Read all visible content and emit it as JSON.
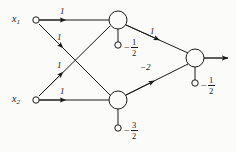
{
  "figure": {
    "kind": "neural-network-diagram",
    "background_color": "#fbfbf9",
    "ink_color": "#1a1a1a",
    "width": 236,
    "height": 152
  },
  "inputs": [
    {
      "id": "x1",
      "label": "x",
      "subscript": "1",
      "x": 28,
      "y": 20
    },
    {
      "id": "x2",
      "label": "x",
      "subscript": "2",
      "x": 28,
      "y": 100
    }
  ],
  "nodes": [
    {
      "id": "h1",
      "role": "hidden-unit-top",
      "cx": 118,
      "cy": 20,
      "r": 9
    },
    {
      "id": "h2",
      "role": "hidden-unit-bottom",
      "cx": 118,
      "cy": 100,
      "r": 9
    },
    {
      "id": "out",
      "role": "output-unit",
      "cx": 195,
      "cy": 58,
      "r": 9
    }
  ],
  "biases": [
    {
      "node": "h1",
      "sign": "−",
      "numerator": "1",
      "denominator": "2",
      "terminal_x": 118,
      "terminal_y": 45
    },
    {
      "node": "h2",
      "sign": "−",
      "numerator": "3",
      "denominator": "2",
      "terminal_x": 118,
      "terminal_y": 128
    },
    {
      "node": "out",
      "sign": "−",
      "numerator": "1",
      "denominator": "2",
      "terminal_x": 195,
      "terminal_y": 83
    }
  ],
  "edges": [
    {
      "id": "x1-h1",
      "from": "x1",
      "to": "h1",
      "weight": "1",
      "label_x": 60,
      "label_y": 10
    },
    {
      "id": "x1-h2",
      "from": "x1",
      "to": "h2",
      "weight": "1",
      "label_x": 57,
      "label_y": 38
    },
    {
      "id": "x2-h1",
      "from": "x2",
      "to": "h1",
      "weight": "1",
      "label_x": 57,
      "label_y": 63
    },
    {
      "id": "x2-h2",
      "from": "x2",
      "to": "h2",
      "weight": "1",
      "label_x": 60,
      "label_y": 90
    },
    {
      "id": "h1-out",
      "from": "h1",
      "to": "out",
      "weight": "1",
      "label_x": 150,
      "label_y": 30
    },
    {
      "id": "h2-out",
      "from": "h2",
      "to": "out",
      "weight": "−2",
      "label_x": 143,
      "label_y": 66
    }
  ],
  "output": {
    "id": "net-output",
    "arrow_from_x": 204,
    "arrow_to_x": 228,
    "y": 58
  }
}
